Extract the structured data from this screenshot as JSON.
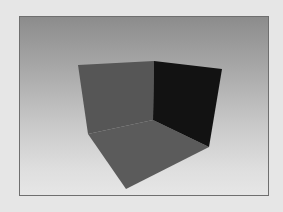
{
  "figure": {
    "description": "Rendered 3D open box corner: two walls and a floor against a gradient background",
    "background_color": "#e6e6e6",
    "frame": {
      "x": 19,
      "y": 16,
      "width": 250,
      "height": 180,
      "border_color": "#6f6f6f",
      "gradient_top": "#8c8c8c",
      "gradient_bottom": "#e6e6e6"
    },
    "faces": [
      {
        "name": "left-wall",
        "fill": "#565656",
        "points": "78,65 154,61 153,120 88,134"
      },
      {
        "name": "right-wall",
        "fill": "#121212",
        "points": "154,61 222,69 209,147 153,120"
      },
      {
        "name": "floor",
        "fill": "#5b5b5b",
        "points": "88,134 153,120 209,147 126,189"
      }
    ]
  }
}
